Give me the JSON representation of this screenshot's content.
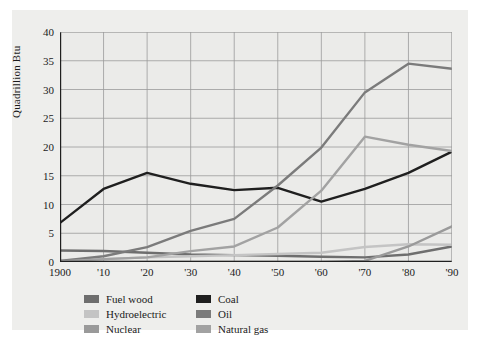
{
  "chart_data": {
    "type": "line",
    "title": "",
    "xlabel": "",
    "ylabel": "Quadrillion Btu",
    "xlim": [
      1900,
      1990
    ],
    "ylim": [
      0,
      40
    ],
    "yticks": [
      0,
      5,
      10,
      15,
      20,
      25,
      30,
      35,
      40
    ],
    "xticks": [
      1900,
      1910,
      1920,
      1930,
      1940,
      1950,
      1960,
      1970,
      1980,
      1990
    ],
    "xtick_labels": [
      "1900",
      "'10",
      "'20",
      "'30",
      "'40",
      "'50",
      "'60",
      "'70",
      "'80",
      "'90"
    ],
    "ytick_labels": [
      "0",
      "5",
      "10",
      "15",
      "20",
      "25",
      "30",
      "35",
      "40"
    ],
    "grid": true,
    "legend_position": "below",
    "x": [
      1900,
      1910,
      1920,
      1930,
      1940,
      1950,
      1960,
      1970,
      1980,
      1990
    ],
    "series": [
      {
        "name": "Fuel wood",
        "color": "#6e6e6e",
        "values": [
          2.0,
          1.9,
          1.6,
          1.3,
          1.2,
          1.1,
          0.9,
          0.8,
          1.3,
          2.7
        ]
      },
      {
        "name": "Hydroelectric",
        "color": "#c4c4c4",
        "values": [
          0.3,
          0.5,
          0.8,
          1.0,
          1.2,
          1.4,
          1.6,
          2.6,
          3.1,
          3.0
        ]
      },
      {
        "name": "Nuclear",
        "color": "#9a9a9a",
        "values": [
          0.0,
          0.0,
          0.0,
          0.0,
          0.0,
          0.0,
          0.0,
          0.2,
          2.7,
          6.2
        ]
      },
      {
        "name": "Coal",
        "color": "#1f1f1f",
        "values": [
          6.8,
          12.7,
          15.5,
          13.6,
          12.5,
          12.9,
          10.5,
          12.7,
          15.5,
          19.2
        ]
      },
      {
        "name": "Oil",
        "color": "#7b7b7b",
        "values": [
          0.2,
          1.0,
          2.6,
          5.4,
          7.5,
          13.3,
          19.9,
          29.5,
          34.5,
          33.6
        ]
      },
      {
        "name": "Natural gas",
        "color": "#a2a2a2",
        "values": [
          0.1,
          0.5,
          0.8,
          1.9,
          2.7,
          6.0,
          12.4,
          21.8,
          20.4,
          19.3
        ]
      }
    ]
  },
  "legend": {
    "columns": [
      {
        "items": [
          {
            "label": "Fuel wood",
            "color": "#6e6e6e"
          },
          {
            "label": "Hydroelectric",
            "color": "#c4c4c4"
          },
          {
            "label": "Nuclear",
            "color": "#9a9a9a"
          }
        ]
      },
      {
        "items": [
          {
            "label": "Coal",
            "color": "#1f1f1f"
          },
          {
            "label": "Oil",
            "color": "#7b7b7b"
          },
          {
            "label": "Natural gas",
            "color": "#a2a2a2"
          }
        ]
      }
    ]
  },
  "colors": {
    "background": "#ffffff",
    "card": "#eeeeec",
    "axis": "#1f1f1f",
    "grid": "#9b9b9b",
    "text": "#1b1b1b"
  }
}
